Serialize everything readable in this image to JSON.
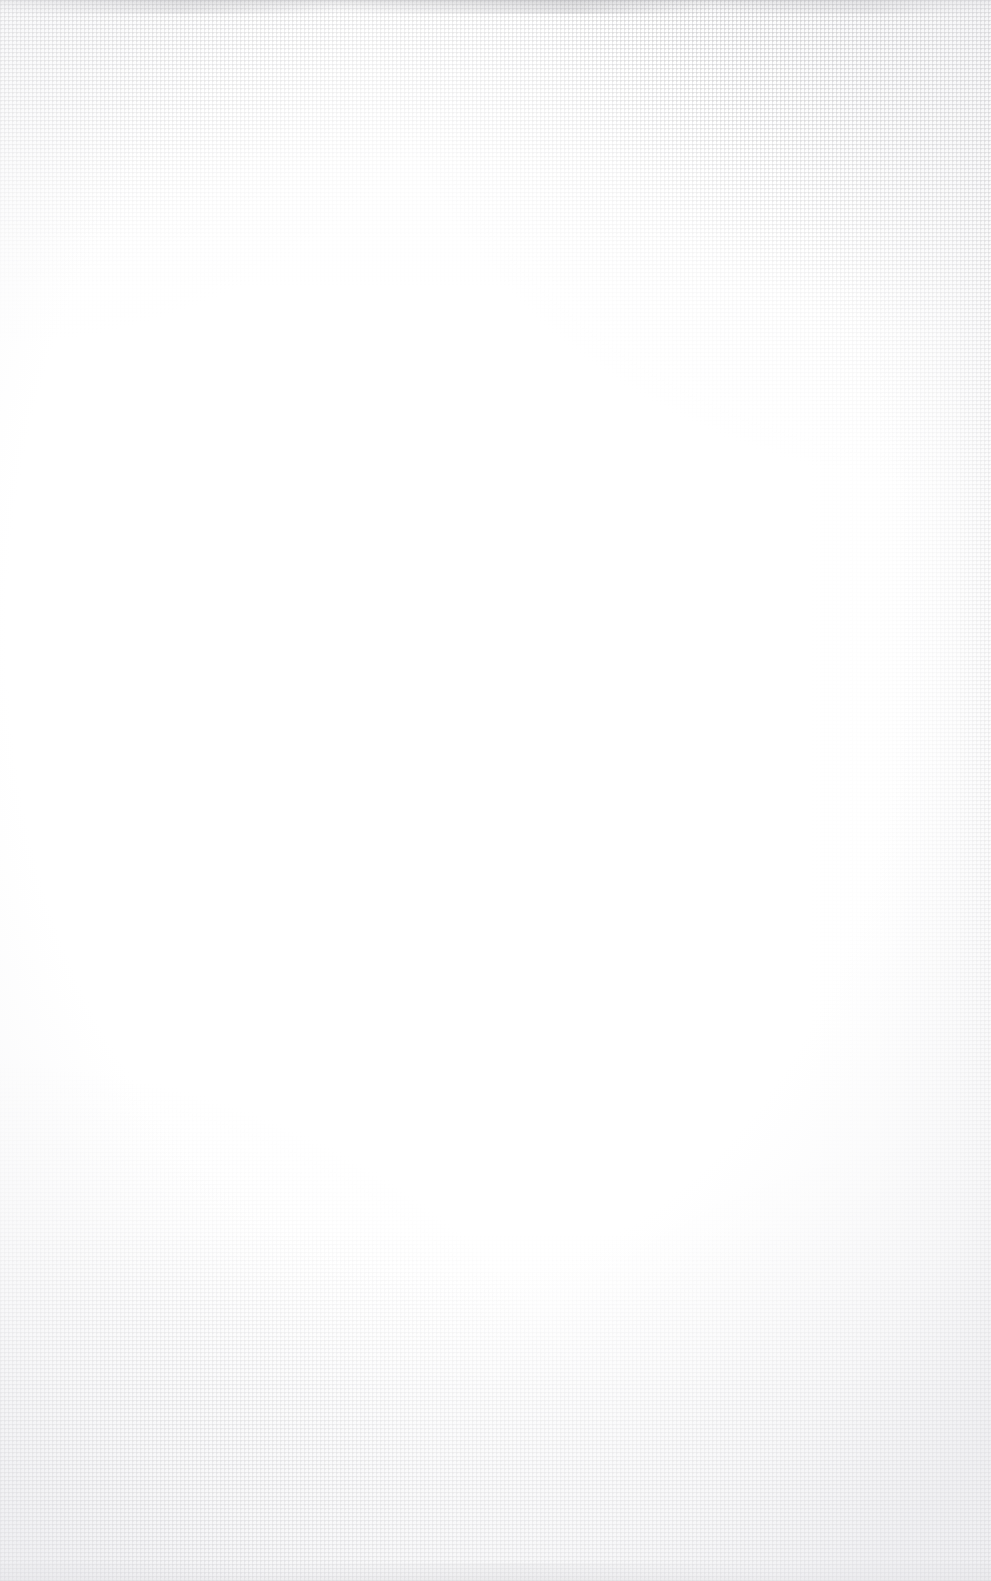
{
  "page": {
    "kind": "blank-scanned-page",
    "width": 991,
    "height": 1581,
    "visible_text": "",
    "caption": ""
  },
  "colors": {
    "paper_base": "#ffffff",
    "weave_thread": "#787880",
    "weave_knot": "#5f5f64",
    "edge_smudge": "#9a9a9e",
    "vignette": "#ecECEF"
  },
  "texture": {
    "name": "woven-canvas-weave",
    "pitch_px": 4,
    "thread_px": 1,
    "regions": [
      {
        "name": "top-right-corner",
        "intensity": "strongest"
      },
      {
        "name": "bottom-left-corner",
        "intensity": "strong"
      },
      {
        "name": "bottom-right-corner",
        "intensity": "strong"
      },
      {
        "name": "top-left-corner",
        "intensity": "moderate"
      },
      {
        "name": "top-edge-band",
        "intensity": "faint"
      },
      {
        "name": "bottom-edge-band",
        "intensity": "faint"
      },
      {
        "name": "right-edge-strip",
        "intensity": "faint"
      },
      {
        "name": "center",
        "intensity": "none"
      }
    ]
  }
}
